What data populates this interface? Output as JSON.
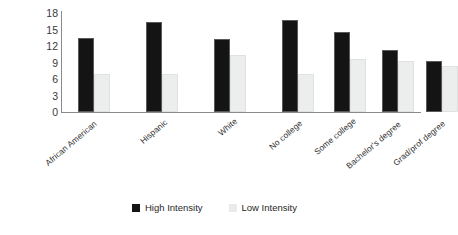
{
  "chart_data": {
    "type": "bar",
    "title": "",
    "subtitle": "",
    "xlabel": "",
    "ylabel": "",
    "ylim": [
      0,
      18
    ],
    "yticks": [
      0,
      3,
      6,
      9,
      12,
      15,
      18
    ],
    "ytick_labels": [
      "0",
      "3",
      "6",
      "9",
      "12",
      "15",
      "18"
    ],
    "grid": false,
    "legend_position": "bottom-center",
    "categories": [
      "African American",
      "Hispanic",
      "White",
      "No college",
      "Some college",
      "Bachelor's degree",
      "Grad/prof degree"
    ],
    "group_breaks": [
      3
    ],
    "series": [
      {
        "name": "High Intensity",
        "color": "#141414",
        "values": [
          13.4,
          16.3,
          13.3,
          16.8,
          14.6,
          11.2,
          9.2
        ]
      },
      {
        "name": "Low Intensity",
        "color": "#ebecec",
        "values": [
          7.0,
          7.0,
          10.4,
          7.0,
          9.7,
          9.3,
          8.3
        ]
      }
    ]
  },
  "legend": {
    "items": [
      {
        "label": "High Intensity",
        "swatch": "dark-square-swatch"
      },
      {
        "label": "Low Intensity",
        "swatch": "light-square-swatch"
      }
    ]
  },
  "colors": {
    "high_intensity": "#141414",
    "low_intensity": "#ebecec",
    "axis": "#8a8a8a",
    "tick_text": "#3a3a3a",
    "label_text": "#2e2e2e",
    "background": "#ffffff"
  }
}
